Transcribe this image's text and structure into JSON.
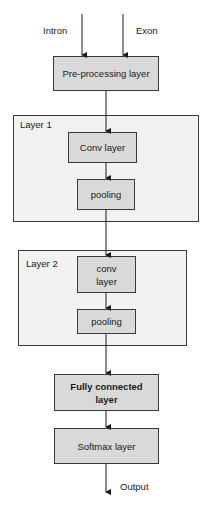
{
  "diagram": {
    "inputs": [
      "Intron",
      "Exon"
    ],
    "nodes": {
      "preprocessing": "Pre-processing layer",
      "layer1_conv": "Conv layer",
      "layer1_pool": "pooling",
      "layer2_conv": "conv layer",
      "layer2_pool": "pooling",
      "fully_connected": "Fully connected layer",
      "softmax": "Softmax layer"
    },
    "groups": {
      "layer1": "Layer 1",
      "layer2": "Layer 2"
    },
    "output": "Output",
    "colors": {
      "node_fill": "#d9d9d9",
      "group_fill": "#f2f2f2",
      "stroke": "#3a3a3a"
    }
  }
}
